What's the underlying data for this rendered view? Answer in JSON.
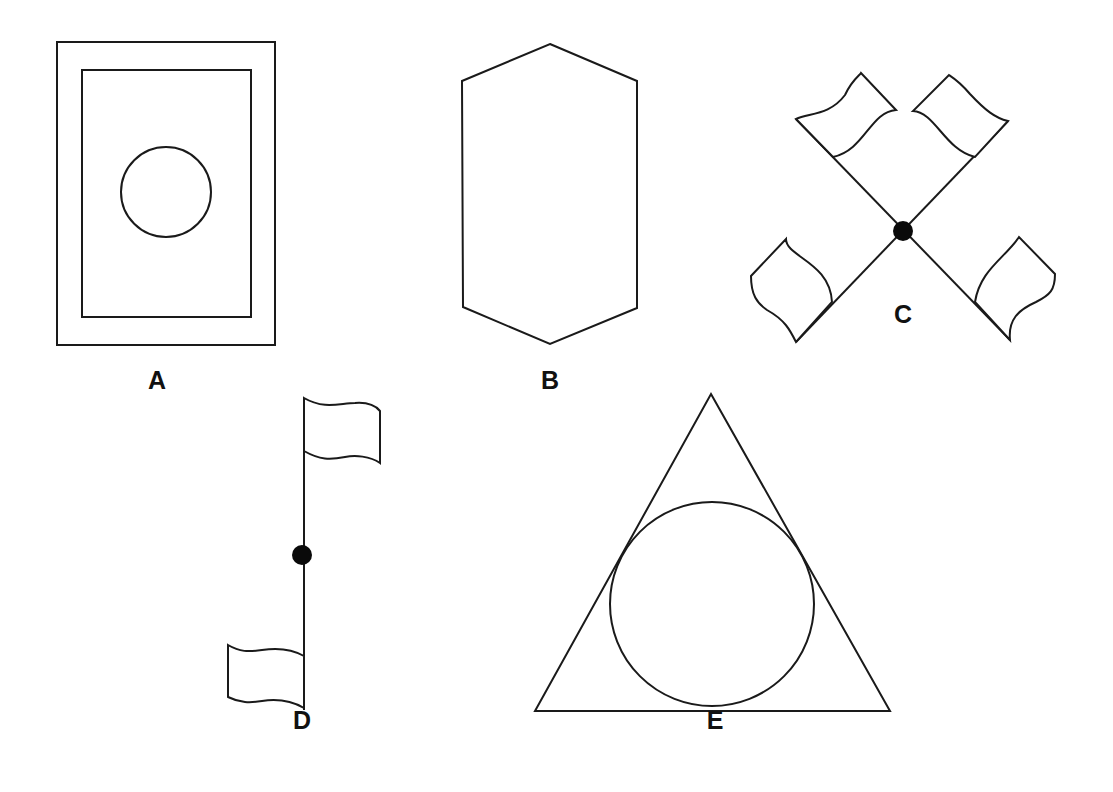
{
  "figures": [
    {
      "id": "A",
      "label": "A",
      "description": "Rectangle inside rectangle with circle in center",
      "label_pos": [
        157,
        368
      ]
    },
    {
      "id": "B",
      "label": "B",
      "description": "Elongated vertical hexagon",
      "label_pos": [
        550,
        368
      ]
    },
    {
      "id": "C",
      "label": "C",
      "description": "Two crossed poles with four flags and center dot",
      "label_pos": [
        903,
        302
      ]
    },
    {
      "id": "D",
      "label": "D",
      "description": "Vertical pole with two flags on opposite sides and center dot",
      "label_pos": [
        302,
        708
      ]
    },
    {
      "id": "E",
      "label": "E",
      "description": "Triangle with inscribed circle",
      "label_pos": [
        715,
        708
      ]
    }
  ],
  "colors": {
    "stroke": "#1a1a1a",
    "background": "#ffffff",
    "dot": "#0a0a0a"
  }
}
